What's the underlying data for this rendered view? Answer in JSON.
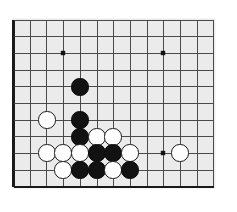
{
  "app": {
    "title": "Go Board Diagram",
    "kind": "goban-diagram"
  },
  "board": {
    "label": "Go board",
    "background_color": "#ebebeb",
    "line_color": "#4a4a4a",
    "thick_border_color": "#1a1a1a",
    "page_background": "#ffffff",
    "black_stone_color": "#121212",
    "white_stone_color": "#fdfdfd",
    "stone_outline_color": "#1a1a1a",
    "grid": {
      "origin_x": 13.5,
      "origin_y": 20.0,
      "spacing": 16.7,
      "cols": 13,
      "rows": 11,
      "left_edge_thick": true,
      "bottom_edge_thick": true,
      "right_edge_visible": true,
      "top_edge_visible": true
    },
    "star_points": [
      {
        "name": "star-point-upper-left",
        "x": 63,
        "y": 53
      },
      {
        "name": "star-point-upper-right",
        "x": 163,
        "y": 53
      },
      {
        "name": "star-point-lower-right",
        "x": 163,
        "y": 153
      }
    ],
    "star_point_radius": 2.2,
    "stone_radius": 8.6,
    "stones": [
      {
        "color": "black",
        "x": 80,
        "y": 87,
        "label": "black-stone-1"
      },
      {
        "color": "white",
        "x": 47,
        "y": 120,
        "label": "white-stone-1"
      },
      {
        "color": "black",
        "x": 80,
        "y": 120,
        "label": "black-stone-2"
      },
      {
        "color": "black",
        "x": 80,
        "y": 137,
        "label": "black-stone-3"
      },
      {
        "color": "white",
        "x": 97,
        "y": 137,
        "label": "white-stone-2"
      },
      {
        "color": "white",
        "x": 113,
        "y": 137,
        "label": "white-stone-3"
      },
      {
        "color": "white",
        "x": 47,
        "y": 153,
        "label": "white-stone-4"
      },
      {
        "color": "white",
        "x": 63,
        "y": 153,
        "label": "white-stone-5"
      },
      {
        "color": "white",
        "x": 80,
        "y": 153,
        "label": "white-stone-6"
      },
      {
        "color": "black",
        "x": 97,
        "y": 153,
        "label": "black-stone-4"
      },
      {
        "color": "black",
        "x": 113,
        "y": 153,
        "label": "black-stone-5"
      },
      {
        "color": "white",
        "x": 130,
        "y": 153,
        "label": "white-stone-7"
      },
      {
        "color": "white",
        "x": 180,
        "y": 153,
        "label": "white-stone-8"
      },
      {
        "color": "white",
        "x": 63,
        "y": 170,
        "label": "white-stone-9"
      },
      {
        "color": "black",
        "x": 80,
        "y": 170,
        "label": "black-stone-6"
      },
      {
        "color": "black",
        "x": 97,
        "y": 170,
        "label": "black-stone-7"
      },
      {
        "color": "white",
        "x": 113,
        "y": 170,
        "label": "white-stone-10"
      },
      {
        "color": "black",
        "x": 130,
        "y": 170,
        "label": "black-stone-8"
      }
    ],
    "counts": {
      "black_stones": 8,
      "white_stones": 10,
      "total_stones": 18
    }
  }
}
